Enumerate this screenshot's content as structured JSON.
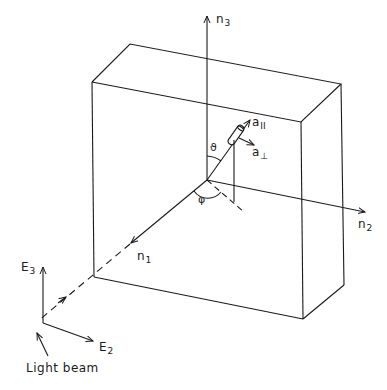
{
  "diagram": {
    "labels": {
      "n3": {
        "base": "n",
        "sub": "3"
      },
      "n2": {
        "base": "n",
        "sub": "2"
      },
      "n1": {
        "base": "n",
        "sub": "1"
      },
      "a_parallel": {
        "base": "a",
        "sub": "II"
      },
      "a_perp": {
        "base": "a",
        "sub": "⊥"
      },
      "theta": "ϑ",
      "phi": "φ",
      "E3": {
        "base": "E",
        "sub": "3"
      },
      "E2": {
        "base": "E",
        "sub": "2"
      },
      "light_beam": "Light beam"
    },
    "colors": {
      "line": "#1a1a1a",
      "background": "#ffffff"
    }
  }
}
